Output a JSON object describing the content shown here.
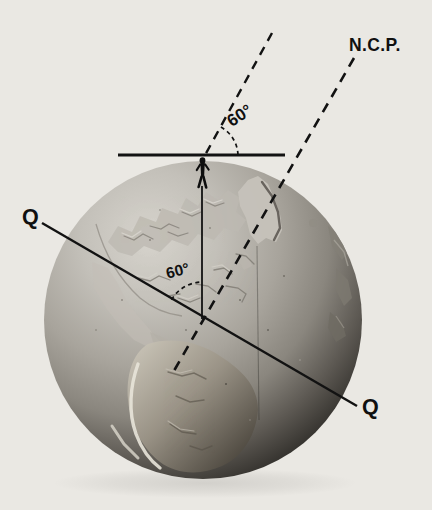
{
  "figure": {
    "kind": "astronomy-textbook-diagram",
    "labels": {
      "north_celestial_pole": "N.C.P.",
      "pole_altitude_angle": "60°",
      "latitude_angle": "60°",
      "equator_left": "Q",
      "equator_right": "Q"
    },
    "icons": {
      "observer": "observer-stick-figure-icon",
      "globe": "relief-globe-photograph"
    },
    "colors": {
      "background": "#eae8e3",
      "ink": "#111111",
      "globe_highlight": "#d6d3cc",
      "globe_midtone": "#a19d95",
      "globe_shadow": "#141311"
    }
  }
}
